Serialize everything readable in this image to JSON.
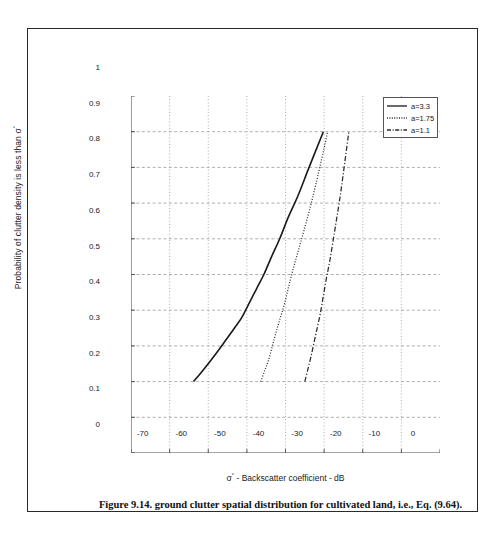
{
  "figure": {
    "caption": "Figure 9.14. ground clutter spatial distribution for cultivated land, i.e., Eq. (9.64).",
    "border_color": "#2a2a2a"
  },
  "chart_data": {
    "type": "line",
    "title": "",
    "xlabel": "σ° - Backscatter coefficient - dB",
    "ylabel": "Probability of clutter density is less than σ°",
    "xlim": [
      -80,
      0
    ],
    "ylim": [
      0,
      1
    ],
    "xticks": [
      -80,
      -70,
      -60,
      -50,
      -40,
      -30,
      -20,
      -10,
      0
    ],
    "xticklabels": [
      "",
      "-70",
      "-60",
      "-50",
      "-40",
      "-30",
      "-20",
      "-10",
      "0"
    ],
    "yticks": [
      0,
      0.1,
      0.2,
      0.3,
      0.4,
      0.5,
      0.6,
      0.7,
      0.8,
      0.9,
      1
    ],
    "yticklabels": [
      "0",
      "0.1",
      "0.2",
      "0.3",
      "0.4",
      "0.5",
      "0.6",
      "0.7",
      "0.8",
      "0.9",
      "1"
    ],
    "grid": true,
    "grid_color": "#9a9a9a",
    "legend_position": "upper right",
    "series": [
      {
        "name": "a=3.3",
        "style": "solid",
        "color": "#1a1a1a",
        "x": [
          -63.8,
          -61.5,
          -59.3,
          -57.2,
          -55.2,
          -53.2,
          -51.3,
          -49.4,
          -47.5,
          -45.6,
          -43.6,
          -41.5,
          -39.3,
          -36.8,
          -33.9,
          -30.2
        ],
        "y": [
          0.2,
          0.23,
          0.26,
          0.29,
          0.32,
          0.35,
          0.38,
          0.42,
          0.46,
          0.5,
          0.55,
          0.6,
          0.66,
          0.72,
          0.8,
          0.9
        ]
      },
      {
        "name": "a=1.75",
        "style": "dotted",
        "color": "#2b2b2b",
        "x": [
          -46.4,
          -45.4,
          -44.4,
          -43.4,
          -42.4,
          -41.3,
          -40.2,
          -39.1,
          -37.9,
          -36.6,
          -35.3,
          -33.8,
          -32.2,
          -30.3,
          -29.1
        ],
        "y": [
          0.2,
          0.23,
          0.26,
          0.3,
          0.34,
          0.38,
          0.42,
          0.47,
          0.52,
          0.57,
          0.62,
          0.68,
          0.75,
          0.84,
          0.9
        ]
      },
      {
        "name": "a=1.1",
        "style": "dashdot",
        "color": "#2b2b2b",
        "x": [
          -35.0,
          -34.2,
          -33.4,
          -32.6,
          -31.8,
          -31.0,
          -30.2,
          -29.4,
          -28.5,
          -27.6,
          -26.7,
          -25.7,
          -24.7,
          -23.6
        ],
        "y": [
          0.2,
          0.235,
          0.27,
          0.31,
          0.35,
          0.39,
          0.44,
          0.49,
          0.54,
          0.6,
          0.66,
          0.73,
          0.81,
          0.9
        ]
      }
    ]
  }
}
